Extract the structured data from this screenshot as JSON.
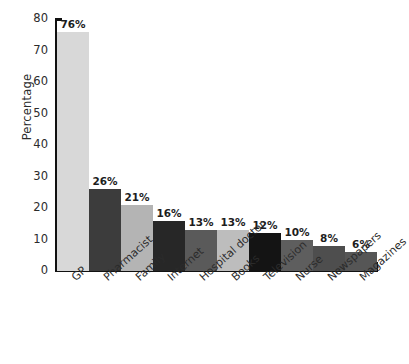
{
  "chart_data": {
    "type": "bar",
    "title": "",
    "xlabel": "",
    "ylabel": "Percentage",
    "ylim": [
      0,
      80
    ],
    "yticks": [
      0,
      10,
      20,
      30,
      40,
      50,
      60,
      70,
      80
    ],
    "grid": false,
    "legend": "none",
    "categories": [
      "GP",
      "Pharmacist",
      "Family",
      "Internet",
      "Hospital doctor",
      "Books",
      "Television",
      "Nurse",
      "Newspapers",
      "Magazines"
    ],
    "values": [
      76,
      26,
      21,
      16,
      13,
      13,
      12,
      10,
      8,
      6
    ],
    "value_labels": [
      "76%",
      "26%",
      "21%",
      "16%",
      "13%",
      "13%",
      "12%",
      "10%",
      "8%",
      "6%"
    ],
    "bar_colors": [
      "#d8d8d8",
      "#3c3c3c",
      "#b4b4b4",
      "#272727",
      "#5a5a5a",
      "#bdbdbd",
      "#141414",
      "#5e5e5e",
      "#4e4e4e",
      "#565656"
    ]
  },
  "axis": {
    "y_label": "Percentage",
    "y_ticks": [
      "0",
      "10",
      "20",
      "30",
      "40",
      "50",
      "60",
      "70",
      "80"
    ]
  }
}
